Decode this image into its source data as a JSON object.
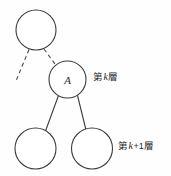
{
  "figure": {
    "background_color": "#fefefe",
    "stroke_color": "#3c3c3c",
    "text_color": "#2b2b2b"
  },
  "nodes": [
    {
      "id": "parent-node",
      "label": "",
      "cx": 36,
      "cy": 30,
      "r": 20
    },
    {
      "id": "node-a",
      "label": "A",
      "cx": 67.5,
      "cy": 79.5,
      "r": 18.5
    },
    {
      "id": "child-left-node",
      "label": "",
      "cx": 35.5,
      "cy": 148.5,
      "r": 20.5
    },
    {
      "id": "child-right-node",
      "label": "",
      "cx": 92,
      "cy": 148.5,
      "r": 20.5
    }
  ],
  "edges": [
    {
      "id": "edge-parent-to-left-dashed",
      "style": "dashed",
      "x1": 29,
      "y1": 49.5,
      "x2": 16,
      "y2": 81
    },
    {
      "id": "edge-parent-to-a-dashed",
      "style": "dashed",
      "x1": 44,
      "y1": 49,
      "x2": 55,
      "y2": 64
    },
    {
      "id": "edge-a-to-child-left",
      "style": "solid",
      "x1": 58.5,
      "y1": 95.5,
      "x2": 45.5,
      "y2": 131
    },
    {
      "id": "edge-a-to-child-right",
      "style": "solid",
      "x1": 77.5,
      "y1": 95.5,
      "x2": 86,
      "y2": 130
    }
  ],
  "labels": {
    "layer_k": {
      "prefix": "第",
      "variable": "k",
      "suffix": "層",
      "full_text": "第 k 層"
    },
    "layer_k_plus_1": {
      "prefix": "第",
      "variable": "k",
      "operator": "+1",
      "suffix": "層",
      "full_text": "第 k+1 層"
    }
  }
}
